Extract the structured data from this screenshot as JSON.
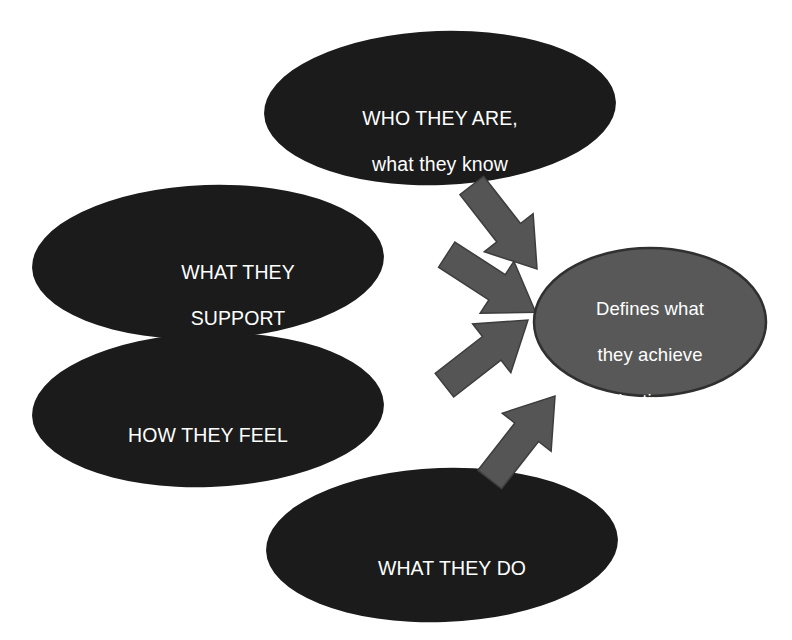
{
  "diagram": {
    "background_color": "#ffffff",
    "source_node_fill": "#1b1b1b",
    "source_node_text_color": "#ffffff",
    "result_node_fill": "#585858",
    "result_node_stroke": "#303030",
    "result_node_text_color": "#ffffff",
    "arrow_fill": "#555555",
    "arrow_stroke": "#3d3d3d",
    "nodes": [
      {
        "id": "who-they-are",
        "shape": "ellipse",
        "text": "WHO THEY ARE,\nwhat they know",
        "line1": "WHO THEY ARE,",
        "line2": "what they know",
        "role": "source"
      },
      {
        "id": "what-they-support",
        "shape": "ellipse",
        "text": "WHAT THEY\nSUPPORT",
        "line1": "WHAT THEY",
        "line2": "SUPPORT",
        "role": "source"
      },
      {
        "id": "how-they-feel",
        "shape": "ellipse",
        "text": "HOW THEY FEEL",
        "line1": "HOW THEY FEEL",
        "role": "source"
      },
      {
        "id": "what-they-do",
        "shape": "ellipse",
        "text": "WHAT THEY DO",
        "line1": "WHAT THEY DO",
        "role": "source"
      },
      {
        "id": "defines-what-they-achieve",
        "shape": "ellipse",
        "text": "Defines what\nthey achieve\n(Collective work\nproduct)",
        "line1": "Defines what",
        "line2": "they achieve",
        "line3": "(Collective work",
        "line4": "product)",
        "role": "result"
      }
    ],
    "connectors": [
      {
        "id": "arrow-who-they-are",
        "from": "who-they-are",
        "to": "defines-what-they-achieve",
        "style": "block-arrow",
        "direction": "down-right"
      },
      {
        "id": "arrow-what-they-support",
        "from": "what-they-support",
        "to": "defines-what-they-achieve",
        "style": "block-arrow",
        "direction": "down-right"
      },
      {
        "id": "arrow-how-they-feel",
        "from": "how-they-feel",
        "to": "defines-what-they-achieve",
        "style": "block-arrow",
        "direction": "up-right"
      },
      {
        "id": "arrow-what-they-do",
        "from": "what-they-do",
        "to": "defines-what-they-achieve",
        "style": "block-arrow",
        "direction": "up-right"
      }
    ]
  }
}
